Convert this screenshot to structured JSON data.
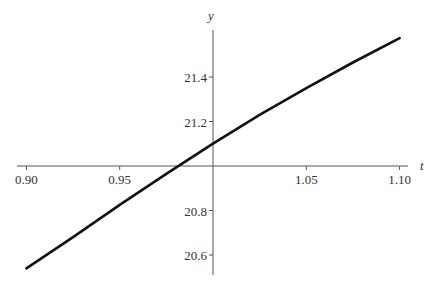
{
  "chart_data": {
    "type": "line",
    "title": "",
    "xlabel": "t",
    "ylabel": "y",
    "xlim": [
      0.9,
      1.1
    ],
    "ylim": [
      20.5,
      21.6
    ],
    "x_ticks": [
      "0.90",
      "0.95",
      "1.05",
      "1.10"
    ],
    "y_ticks": [
      "21.4",
      "21.2",
      "20.8",
      "20.6"
    ],
    "grid": false,
    "axes_cross_at": {
      "t": 1.0,
      "y": 21.0
    },
    "series": [
      {
        "name": "y(t)",
        "x": [
          0.9,
          0.925,
          0.95,
          0.975,
          1.0,
          1.025,
          1.05,
          1.075,
          1.1
        ],
        "y": [
          20.54,
          20.68,
          20.825,
          20.965,
          21.1,
          21.23,
          21.35,
          21.465,
          21.575
        ]
      }
    ]
  }
}
